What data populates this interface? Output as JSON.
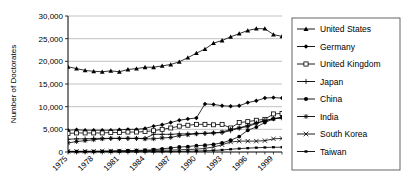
{
  "chart_data": {
    "type": "line",
    "title": "",
    "xlabel": "",
    "ylabel": "Number of Doctorates",
    "ylim": [
      0,
      30000
    ],
    "ytick_labels": [
      "0",
      "5,000",
      "10,000",
      "15,000",
      "20,000",
      "25,000",
      "30,000"
    ],
    "ytick_values": [
      0,
      5000,
      10000,
      15000,
      20000,
      25000,
      30000
    ],
    "xlim": [
      1975,
      2000
    ],
    "xtick_labels": [
      "1975",
      "1978",
      "1981",
      "1984",
      "1987",
      "1990",
      "1993",
      "1996",
      "1999"
    ],
    "xtick_values": [
      1975,
      1978,
      1981,
      1984,
      1987,
      1990,
      1993,
      1996,
      1999
    ],
    "x": [
      1975,
      1976,
      1977,
      1978,
      1979,
      1980,
      1981,
      1982,
      1983,
      1984,
      1985,
      1986,
      1987,
      1988,
      1989,
      1990,
      1991,
      1992,
      1993,
      1994,
      1995,
      1996,
      1997,
      1998,
      1999,
      2000
    ],
    "grid": "horizontal",
    "legend_position": "right",
    "series": [
      {
        "name": "United States",
        "marker": "triangle",
        "color": "#000000",
        "values": [
          18800,
          18400,
          18000,
          17800,
          17700,
          17900,
          17700,
          18200,
          18400,
          18700,
          18700,
          19000,
          19300,
          19900,
          20800,
          21800,
          22700,
          24000,
          24600,
          25400,
          26100,
          26800,
          27200,
          27200,
          25900,
          25500
        ]
      },
      {
        "name": "Germany",
        "marker": "diamond",
        "color": "#000000",
        "values": [
          4800,
          4900,
          4800,
          4800,
          4800,
          4800,
          4900,
          5000,
          5000,
          5200,
          5700,
          6000,
          6500,
          7000,
          7300,
          7500,
          10600,
          10500,
          10200,
          10100,
          10200,
          10900,
          11300,
          11900,
          12000,
          11900
        ]
      },
      {
        "name": "United Kingdom",
        "marker": "open-square",
        "color": "#000000",
        "values": [
          4100,
          4200,
          4200,
          4200,
          4200,
          4300,
          4300,
          4400,
          4400,
          4500,
          4700,
          5000,
          5300,
          5700,
          5900,
          6100,
          6100,
          6000,
          6100,
          5300,
          6500,
          6700,
          7000,
          7200,
          8400,
          8500
        ]
      },
      {
        "name": "Japan",
        "marker": "plus",
        "color": "#000000",
        "values": [
          2800,
          2900,
          2900,
          3000,
          3000,
          3000,
          3000,
          3000,
          3000,
          3000,
          3900,
          3900,
          3900,
          4000,
          4000,
          4100,
          4100,
          4200,
          4300,
          4700,
          5300,
          5900,
          6400,
          6900,
          7400,
          7500
        ]
      },
      {
        "name": "China",
        "marker": "filled-circle",
        "color": "#000000",
        "values": [
          100,
          100,
          100,
          100,
          150,
          200,
          250,
          300,
          350,
          400,
          500,
          700,
          900,
          1100,
          1200,
          1400,
          1500,
          1700,
          2000,
          2600,
          3400,
          4800,
          5500,
          6500,
          7300,
          7700
        ]
      },
      {
        "name": "India",
        "marker": "star",
        "color": "#000000",
        "values": [
          2000,
          2300,
          2500,
          2700,
          2900,
          3000,
          3000,
          3000,
          3000,
          2900,
          2900,
          3100,
          3200,
          3600,
          3800,
          4000,
          4100,
          4200,
          4400,
          5000,
          5300,
          5600,
          6300,
          6900,
          7300,
          7600
        ]
      },
      {
        "name": "South Korea",
        "marker": "x",
        "color": "#000000",
        "values": [
          150,
          160,
          170,
          180,
          190,
          200,
          220,
          250,
          280,
          300,
          340,
          380,
          420,
          480,
          550,
          620,
          800,
          1100,
          1600,
          2200,
          2400,
          2400,
          2400,
          2500,
          2900,
          3000
        ]
      },
      {
        "name": "Taiwan",
        "marker": "small-square",
        "color": "#000000",
        "values": [
          60,
          60,
          60,
          60,
          70,
          70,
          80,
          80,
          90,
          90,
          100,
          110,
          120,
          140,
          160,
          200,
          260,
          340,
          450,
          600,
          750,
          850,
          950,
          1000,
          1050,
          1050
        ]
      }
    ]
  }
}
